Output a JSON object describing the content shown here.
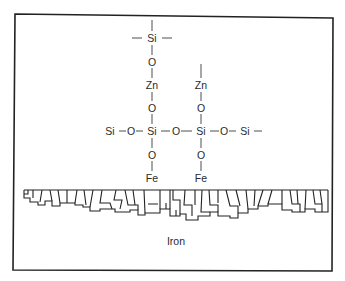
{
  "diagram": {
    "substrate_label": "Iron",
    "atoms": {
      "top_si": "Si",
      "left_column": [
        "Si",
        "O",
        "Zn",
        "O",
        "Si",
        "O",
        "Fe"
      ],
      "right_column": [
        "Zn",
        "O",
        "Si",
        "O",
        "Fe"
      ],
      "chain_row": [
        "Si",
        "O",
        "Si",
        "O",
        "Si",
        "O",
        "Si"
      ]
    },
    "labels": {
      "si_top": "Si",
      "o_1": "O",
      "zn_left": "Zn",
      "zn_right": "Zn",
      "o_2_left": "O",
      "o_2_right": "O",
      "si_chain_1": "Si",
      "o_chain_1": "O",
      "si_chain_2": "Si",
      "o_chain_2": "O",
      "si_chain_3": "Si",
      "o_chain_3": "O",
      "si_chain_4": "Si",
      "o_3_left": "O",
      "o_3_right": "O",
      "fe_left": "Fe",
      "fe_right": "Fe",
      "iron": "Iron"
    }
  }
}
